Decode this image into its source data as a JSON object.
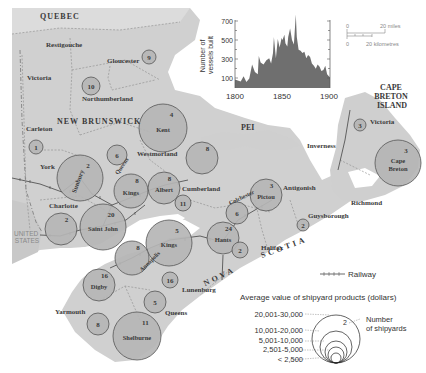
{
  "map": {
    "regions": {
      "quebec": "QUEBEC",
      "new_brunswick": "NEW BRUNSWICK",
      "pei": "PEI",
      "cape_breton_island": [
        "CAPE",
        "BRETON",
        "ISLAND"
      ],
      "united_states": [
        "UNITED",
        "STATES"
      ],
      "nova": "NOVA",
      "scotia": "SCOTIA"
    },
    "county_labels": [
      {
        "name": "Restigouche",
        "x": 46,
        "y": 47
      },
      {
        "name": "Gloucester",
        "x": 107,
        "y": 63
      },
      {
        "name": "Victoria",
        "x": 27,
        "y": 80
      },
      {
        "name": "Northumberland",
        "x": 82,
        "y": 101
      },
      {
        "name": "Carleton",
        "x": 26,
        "y": 131
      },
      {
        "name": "York",
        "x": 40,
        "y": 169
      },
      {
        "name": "Charlotte",
        "x": 49,
        "y": 208
      },
      {
        "name": "Westmorland",
        "x": 137,
        "y": 156
      },
      {
        "name": "Cumberland",
        "x": 182,
        "y": 191
      },
      {
        "name": "Inverness",
        "x": 307,
        "y": 148
      },
      {
        "name": "Victoria",
        "x": 370,
        "y": 124
      },
      {
        "name": "Antigonish",
        "x": 283,
        "y": 190
      },
      {
        "name": "Richmond",
        "x": 351,
        "y": 205
      },
      {
        "name": "Guysborough",
        "x": 308,
        "y": 218
      },
      {
        "name": "Halifax",
        "x": 261,
        "y": 250
      },
      {
        "name": "Lunenburg",
        "x": 182,
        "y": 292
      },
      {
        "name": "Queens",
        "x": 165,
        "y": 315
      },
      {
        "name": "Yarmouth",
        "x": 55,
        "y": 314
      }
    ],
    "shipyard_circles": [
      {
        "id": "gloucester",
        "x": 149,
        "y": 57,
        "r": 7,
        "count": "9",
        "name": ""
      },
      {
        "id": "northumberland",
        "x": 91,
        "y": 86,
        "r": 9,
        "count": "10",
        "name": ""
      },
      {
        "id": "carleton",
        "x": 36,
        "y": 147,
        "r": 7,
        "count": "1",
        "name": ""
      },
      {
        "id": "kent",
        "x": 163,
        "y": 128,
        "r": 24,
        "count": "4",
        "name": "Kent"
      },
      {
        "id": "sunbury",
        "x": 80,
        "y": 178,
        "r": 23,
        "count": "2",
        "name": "Sunbury"
      },
      {
        "id": "queens-nb",
        "x": 117,
        "y": 155,
        "r": 10,
        "count": "6",
        "name": ""
      },
      {
        "id": "westmorland",
        "x": 202,
        "y": 158,
        "r": 16,
        "count": "8",
        "name": ""
      },
      {
        "id": "kings-nb",
        "x": 131,
        "y": 191,
        "r": 17,
        "count": "8",
        "name": "Kings"
      },
      {
        "id": "albert",
        "x": 164,
        "y": 188,
        "r": 16,
        "count": "8",
        "name": "Albert"
      },
      {
        "id": "cumberland",
        "x": 183,
        "y": 203,
        "r": 8,
        "count": "11",
        "name": ""
      },
      {
        "id": "charlotte",
        "x": 61,
        "y": 229,
        "r": 16,
        "count": "2",
        "name": ""
      },
      {
        "id": "saint-john",
        "x": 103,
        "y": 227,
        "r": 23,
        "count": "20",
        "name": "Saint John"
      },
      {
        "id": "kings-ns",
        "x": 169,
        "y": 243,
        "r": 23,
        "count": "5",
        "name": "Kings"
      },
      {
        "id": "hants",
        "x": 223,
        "y": 238,
        "r": 16,
        "count": "24",
        "name": "Hants"
      },
      {
        "id": "colchester",
        "x": 237,
        "y": 213,
        "r": 11,
        "count": "6",
        "name": ""
      },
      {
        "id": "pictou",
        "x": 266,
        "y": 195,
        "r": 16,
        "count": "3",
        "name": "Pictou"
      },
      {
        "id": "annapolis",
        "x": 132,
        "y": 258,
        "r": 17,
        "count": "8",
        "name": ""
      },
      {
        "id": "halifax",
        "x": 240,
        "y": 250,
        "r": 8,
        "count": "2",
        "name": ""
      },
      {
        "id": "guysborough",
        "x": 303,
        "y": 225,
        "r": 6,
        "count": "2",
        "name": ""
      },
      {
        "id": "digby",
        "x": 99,
        "y": 285,
        "r": 16,
        "count": "16",
        "name": "Digby"
      },
      {
        "id": "lunenburg",
        "x": 170,
        "y": 280,
        "r": 8,
        "count": "16",
        "name": ""
      },
      {
        "id": "queens-ns",
        "x": 155,
        "y": 302,
        "r": 11,
        "count": "5",
        "name": ""
      },
      {
        "id": "yarmouth",
        "x": 98,
        "y": 324,
        "r": 11,
        "count": "8",
        "name": ""
      },
      {
        "id": "shelburne",
        "x": 137,
        "y": 336,
        "r": 24,
        "count": "11",
        "name": "Shelburne"
      },
      {
        "id": "victoria-cb",
        "x": 360,
        "y": 125,
        "r": 6,
        "count": "3",
        "name": ""
      },
      {
        "id": "cape-breton",
        "x": 398,
        "y": 163,
        "r": 23,
        "count": "3",
        "name": "Cape Breton"
      }
    ],
    "colors": {
      "land": "#d5d5d5",
      "land_dark": "#c4c4c4",
      "water": "#ffffff",
      "circle_fill": "#b5b5b5",
      "circle_stroke": "#555555",
      "border": "#8a8a8a",
      "chart_fill": "#6f6f6f"
    }
  },
  "inset_chart": {
    "ylabel_line1": "Number of",
    "ylabel_line2": "vessels built",
    "y_ticks": [
      "700",
      "500",
      "300",
      "100"
    ],
    "x_ticks": [
      "1800",
      "1850",
      "1900"
    ]
  },
  "scale_bar": {
    "miles_zero": "0",
    "miles_label": "20 miles",
    "km_zero": "0",
    "km_label": "20 kilometres"
  },
  "legend": {
    "railway_label": "Railway",
    "title": "Average value of shipyard products (dollars)",
    "classes": [
      "20,001-30,000",
      "10,001-20,000",
      "5,001-10,000",
      "2,501-5,000",
      "< 2,500"
    ],
    "example_count": "2",
    "number_label_line1": "Number",
    "number_label_line2": "of shipyards"
  },
  "chart_data": {
    "type": "area",
    "title": "",
    "xlabel": "",
    "ylabel": "Number of vessels built",
    "xlim": [
      1800,
      1900
    ],
    "ylim": [
      0,
      700
    ],
    "x_ticks": [
      1800,
      1850,
      1900
    ],
    "y_ticks": [
      100,
      300,
      500,
      700
    ],
    "x": [
      1800,
      1803,
      1806,
      1809,
      1812,
      1815,
      1818,
      1821,
      1824,
      1825,
      1827,
      1830,
      1833,
      1836,
      1838,
      1840,
      1841,
      1843,
      1845,
      1847,
      1849,
      1850,
      1852,
      1853,
      1855,
      1856,
      1858,
      1860,
      1862,
      1864,
      1865,
      1867,
      1869,
      1871,
      1873,
      1875,
      1877,
      1879,
      1881,
      1883,
      1885,
      1887,
      1889,
      1891,
      1893,
      1895,
      1897,
      1900
    ],
    "values": [
      80,
      70,
      60,
      110,
      55,
      90,
      220,
      150,
      130,
      300,
      240,
      220,
      260,
      280,
      230,
      330,
      480,
      280,
      460,
      380,
      470,
      450,
      500,
      420,
      390,
      480,
      560,
      450,
      410,
      690,
      480,
      360,
      350,
      330,
      340,
      280,
      310,
      290,
      230,
      210,
      180,
      220,
      200,
      160,
      170,
      210,
      130,
      100
    ]
  }
}
